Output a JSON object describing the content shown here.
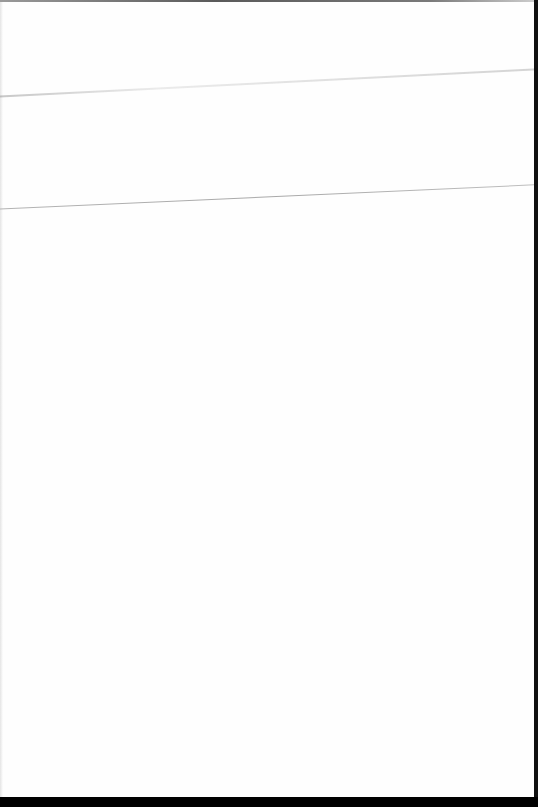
{
  "document": {
    "type": "scanned-page",
    "content": "",
    "colors": {
      "paper": "#fefefe",
      "border": "#000000",
      "crease": "#b4b4b4"
    }
  }
}
